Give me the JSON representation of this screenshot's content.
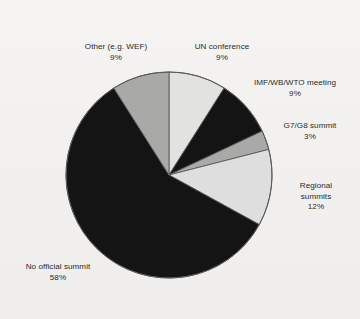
{
  "chart_data": {
    "type": "pie",
    "title": "",
    "subtitle": "",
    "xlabel": "",
    "ylabel": "",
    "legend_position": "none",
    "grid": false,
    "start_angle_deg": 0,
    "direction": "clockwise",
    "unit": "%",
    "categories": [
      "UN conference",
      "IMF/WB/WTO meeting",
      "G7/G8 summit",
      "Regional summits",
      "No official summit",
      "Other (e.g. WEF)"
    ],
    "values": [
      9,
      9,
      3,
      12,
      58,
      9
    ],
    "total": 100,
    "slices": [
      {
        "label": "UN conference",
        "value": 9,
        "pct_text": "9%",
        "color": "#e2e2e0"
      },
      {
        "label": "IMF/WB/WTO meeting",
        "value": 9,
        "pct_text": "9%",
        "color": "#141414"
      },
      {
        "label": "G7/G8 summit",
        "value": 3,
        "pct_text": "3%",
        "color": "#a9a9a7"
      },
      {
        "label": "Regional summits",
        "value": 12,
        "pct_text": "12%",
        "color": "#dedede"
      },
      {
        "label": "No official summit",
        "value": 58,
        "pct_text": "58%",
        "color": "#141414"
      },
      {
        "label": "Other (e.g. WEF)",
        "value": 9,
        "pct_text": "9%",
        "color": "#a9a9a7"
      }
    ]
  },
  "labels": {
    "other": {
      "name": "Other (e.g. WEF)",
      "pct": "9%"
    },
    "un": {
      "name": "UN conference",
      "pct": "9%"
    },
    "imf": {
      "name": "IMF/WB/WTO meeting",
      "pct": "9%"
    },
    "g7": {
      "name": "G7/G8 summit",
      "pct": "3%"
    },
    "regional": {
      "name": "Regional",
      "name2": "summits",
      "pct": "12%"
    },
    "nosummit": {
      "name": "No official summit",
      "pct": "58%"
    }
  },
  "colors": {
    "background": "#f4f3f1",
    "dark": "#141414",
    "mid_gray": "#a9a9a7",
    "light_gray": "#e2e2e0",
    "outline": "#5a5a5a",
    "text": "#2a2a2a"
  }
}
